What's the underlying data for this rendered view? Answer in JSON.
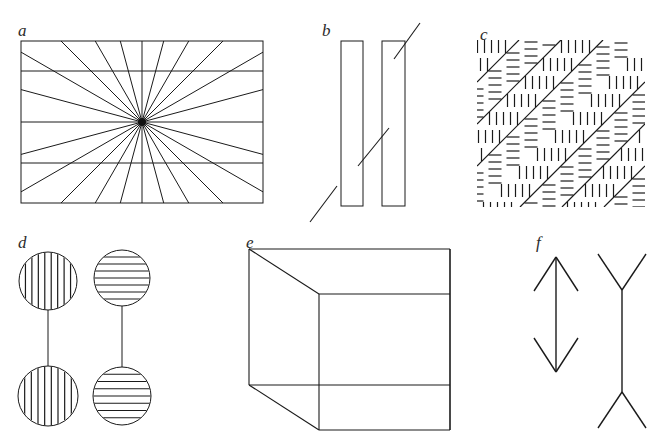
{
  "figure": {
    "background_color": "#ffffff",
    "stroke_color": "#1a1a1a",
    "label_color": "#2b2b2b",
    "width": 656,
    "height": 442
  },
  "panels": [
    {
      "key": "a",
      "label": "a",
      "illusion_name": "Hering illusion",
      "label_x": 18,
      "label_y": 22,
      "frame": {
        "x": 21,
        "y": 41,
        "width": 242,
        "height": 162
      },
      "center": {
        "x": 142,
        "y": 122
      },
      "radial_line_count": 24,
      "horizontal_lines_y": [
        71,
        163
      ],
      "stroke_width": 1
    },
    {
      "key": "b",
      "label": "b",
      "illusion_name": "Poggendorff illusion",
      "label_x": 322,
      "label_y": 22,
      "bars": [
        {
          "x": 341,
          "y": 41,
          "width": 22,
          "height": 165
        },
        {
          "x": 382,
          "y": 41,
          "width": 23,
          "height": 165
        }
      ],
      "diagonal_upper": {
        "x1": 420,
        "y1": 23,
        "x2": 394,
        "y2": 59
      },
      "diagonal_middle": {
        "x1": 389,
        "y1": 128,
        "x2": 358,
        "y2": 166
      },
      "diagonal_lower": {
        "x1": 337,
        "y1": 186,
        "x2": 310,
        "y2": 222
      },
      "stroke_width": 1
    },
    {
      "key": "c",
      "label": "c",
      "illusion_name": "Zollner illusion",
      "label_x": 480,
      "label_y": 26,
      "frame": {
        "x": 477,
        "y": 40,
        "width": 168,
        "height": 167
      },
      "diagonal_count": 5,
      "diagonal_spacing": 42,
      "hatch_spacing": 7,
      "hatch_length": 13,
      "stroke_width": 1
    },
    {
      "key": "d",
      "label": "d",
      "illusion_name": "Helmholtz striped circles",
      "label_x": 18,
      "label_y": 234,
      "circles": [
        {
          "cx": 48,
          "cy": 281,
          "r": 29,
          "stripes": "vertical",
          "stripe_count": 8
        },
        {
          "cx": 122,
          "cy": 278,
          "r": 28,
          "stripes": "horizontal",
          "stripe_count": 7
        },
        {
          "cx": 48,
          "cy": 396,
          "r": 30,
          "stripes": "vertical",
          "stripe_count": 8
        },
        {
          "cx": 122,
          "cy": 396,
          "r": 29,
          "stripes": "horizontal",
          "stripe_count": 7
        }
      ],
      "connectors": [
        {
          "x1": 48,
          "y1": 310,
          "x2": 48,
          "y2": 366
        },
        {
          "x1": 122,
          "y1": 306,
          "x2": 122,
          "y2": 367
        }
      ],
      "stroke_width": 1
    },
    {
      "key": "e",
      "label": "e",
      "illusion_name": "Necker cube",
      "label_x": 246,
      "label_y": 234,
      "front_face": {
        "x": 319,
        "y": 295,
        "width": 60,
        "height": 135
      },
      "back_face": {
        "x": 249,
        "y": 249,
        "width": 60,
        "height": 135
      },
      "vertices": {
        "back_top_left": {
          "x": 249,
          "y": 249
        },
        "back_top_right": {
          "x": 450,
          "y": 249
        },
        "back_bottom_right": {
          "x": 450,
          "y": 385
        },
        "back_bottom_left": {
          "x": 249,
          "y": 385
        },
        "front_top_left": {
          "x": 319,
          "y": 294
        },
        "front_top_right": {
          "x": 450,
          "y": 294
        },
        "front_bottom_right": {
          "x": 450,
          "y": 430
        },
        "front_bottom_left": {
          "x": 319,
          "y": 430
        }
      },
      "stroke_width": 1
    },
    {
      "key": "f",
      "label": "f",
      "illusion_name": "Muller-Lyer illusion",
      "label_x": 536,
      "label_y": 234,
      "shafts": [
        {
          "name": "arrow-in",
          "x": 556,
          "y1": 257,
          "y2": 372,
          "fin_direction": "inward",
          "fin_length": 34,
          "fin_spread": 22
        },
        {
          "name": "arrow-out",
          "x": 622,
          "y1": 290,
          "y2": 392,
          "fin_direction": "outward",
          "fin_length": 36,
          "fin_spread": 24
        }
      ],
      "stroke_width": 1.4
    }
  ]
}
